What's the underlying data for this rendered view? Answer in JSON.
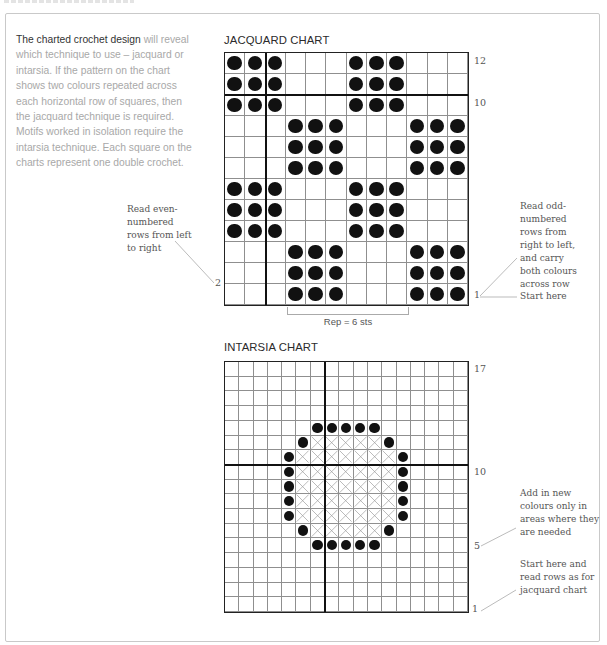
{
  "intro": {
    "lead": "The charted crochet design",
    "body": " will reveal which technique to use – jacquard or intarsia. If the pattern on the chart shows two colours repeated across each horizontal row of squares, then the jacquard technique is required. Motifs worked in isolation require the intarsia technique. Each square on the charts represent one double crochet."
  },
  "jacquard": {
    "title": "JACQUARD CHART",
    "cols": 12,
    "rows": 12,
    "thick_col_after": 2,
    "thick_row_above": 10,
    "row_labels": {
      "top": "12",
      "mid": "10",
      "even": "2",
      "odd": "1"
    },
    "rep_label": "Rep = 6 sts",
    "rep_cols": [
      4,
      9
    ],
    "note_left": "Read even-numbered rows from left to right",
    "note_right": "Read odd-numbered rows from right to left, and carry both colours across row",
    "note_start": "Start here",
    "pattern_rows_top_to_bottom": [
      "XXX...XXX...",
      "XXX...XXX...",
      "XXX...XXX...",
      "...XXX...XXX",
      "...XXX...XXX",
      "...XXX...XXX",
      "XXX...XXX...",
      "XXX...XXX...",
      "XXX...XXX...",
      "...XXX...XXX",
      "...XXX...XXX",
      "...XXX...XXX"
    ]
  },
  "intarsia": {
    "title": "INTARSIA CHART",
    "cols": 17,
    "rows": 17,
    "thick_col_after": 7,
    "thick_row_above": 10,
    "row_labels": {
      "top": "17",
      "mid": "10",
      "five": "5",
      "one": "1"
    },
    "note_colours": "Add in new colours only in areas where they are needed",
    "note_start": "Start here and read rows as for jacquard chart",
    "legend": {
      "D": "dot (contrast colour)",
      "X": "cross (motif fill colour)",
      ".": "background"
    },
    "pattern_rows_top_to_bottom": [
      ".................",
      ".................",
      ".................",
      ".................",
      "......DDDDD......",
      ".....DXXXXXD.....",
      "....DXXXXXXXD....",
      "....DXXXXXXXD....",
      "....DXXXXXXXD....",
      "....DXXXXXXXD....",
      "....DXXXXXXXD....",
      ".....DXXXXXD.....",
      "......DDDDD......",
      ".................",
      ".................",
      ".................",
      "................."
    ]
  }
}
